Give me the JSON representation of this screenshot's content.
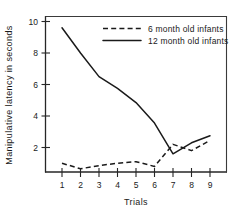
{
  "chart_data": {
    "type": "line",
    "title": "",
    "xlabel": "Trials",
    "ylabel": "Manipulative latency in seconds",
    "x": [
      1,
      2,
      3,
      4,
      5,
      6,
      7,
      8,
      9
    ],
    "xticklabels": [
      "1",
      "2",
      "3",
      "4",
      "5",
      "6",
      "7",
      "8",
      "9"
    ],
    "yticklabels": [
      "2",
      "4",
      "6",
      "8",
      "10"
    ],
    "yticks": [
      2,
      4,
      6,
      8,
      10
    ],
    "xlim": [
      0.6,
      9.6
    ],
    "ylim": [
      0,
      10.6
    ],
    "grid": false,
    "legend_position": "top-right",
    "series": [
      {
        "name": "6 month old infants",
        "style": "dashed",
        "color": "#1a1a1a",
        "values": [
          1.0,
          0.65,
          0.85,
          1.0,
          1.1,
          0.8,
          2.2,
          1.8,
          2.45
        ]
      },
      {
        "name": "12 month old infants",
        "style": "solid",
        "color": "#1a1a1a",
        "values": [
          9.6,
          8.0,
          6.5,
          5.75,
          4.85,
          3.55,
          1.6,
          2.3,
          2.75
        ]
      }
    ]
  },
  "legend": {
    "entries": [
      {
        "label": "6 month old infants",
        "style": "dashed"
      },
      {
        "label": "12 month old infants",
        "style": "solid"
      }
    ]
  },
  "axes": {
    "x_axis_label": "Trials",
    "y_axis_label": "Manipulative latency in seconds"
  }
}
